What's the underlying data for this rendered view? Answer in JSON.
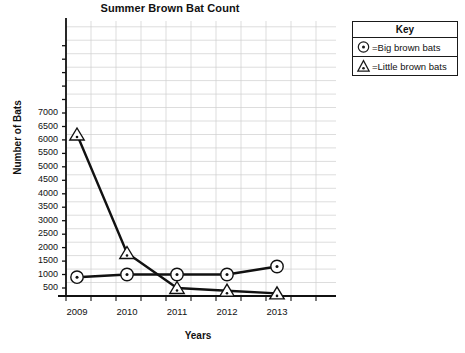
{
  "chart_data": {
    "type": "line",
    "title": "Summer Brown Bat Count",
    "xlabel": "Years",
    "ylabel": "Number of Bats",
    "categories": [
      "2009",
      "2010",
      "2011",
      "2012",
      "2013"
    ],
    "x": [
      2009,
      2010,
      2011,
      2012,
      2013
    ],
    "xlim": [
      2009,
      2013
    ],
    "ylim": [
      0,
      7800
    ],
    "ytick_labels": [
      "500",
      "1000",
      "1500",
      "2000",
      "2500",
      "3000",
      "3500",
      "4000",
      "4500",
      "5000",
      "5500",
      "6000",
      "6500",
      "7000"
    ],
    "ytick_values": [
      500,
      1000,
      1500,
      2000,
      2500,
      3000,
      3500,
      4000,
      4500,
      5000,
      5500,
      6000,
      6500,
      7000
    ],
    "grid": true,
    "legend_position": "top-right",
    "series": [
      {
        "name": "Big brown bats",
        "marker": "circle-dot",
        "values": [
          900,
          1000,
          1000,
          1000,
          1300
        ]
      },
      {
        "name": "Little brown bats",
        "marker": "triangle-dot",
        "values": [
          6200,
          1800,
          500,
          400,
          300
        ]
      }
    ]
  },
  "legend": {
    "title": "Key",
    "items": [
      {
        "icon": "circle-dot-icon",
        "label": "=Big brown bats"
      },
      {
        "icon": "triangle-dot-icon",
        "label": "=Little brown bats"
      }
    ]
  }
}
